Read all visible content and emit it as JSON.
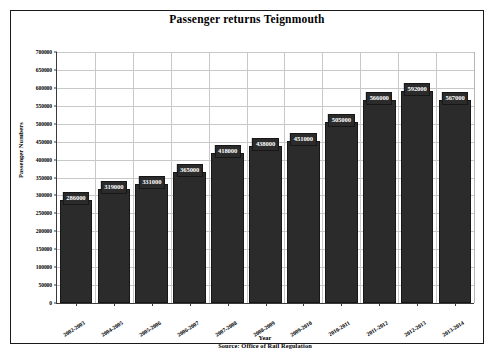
{
  "chart_data": {
    "type": "bar",
    "title": "Passenger returns Teignmouth",
    "xlabel": "Year",
    "ylabel": "Passenger Numbers",
    "source": "Source: Office of Rail Regulation",
    "categories": [
      "2002-2003",
      "2004-2005",
      "2005-2006",
      "2006-2007",
      "2007-2008",
      "2008-2009",
      "2009-2010",
      "2010-2011",
      "2011-2012",
      "2012-2013",
      "2013-2014"
    ],
    "values": [
      286000,
      319000,
      331000,
      365000,
      418000,
      438000,
      451000,
      505000,
      566000,
      592000,
      567000
    ],
    "value_labels": [
      "286000",
      "319000",
      "331000",
      "365000",
      "418000",
      "438000",
      "451000",
      "505000",
      "566000",
      "592000",
      "567000"
    ],
    "ylim": [
      0,
      700000
    ],
    "ytick_values": [
      0,
      50000,
      100000,
      150000,
      200000,
      250000,
      300000,
      350000,
      400000,
      450000,
      500000,
      550000,
      600000,
      650000,
      700000
    ],
    "ytick_labels": [
      "0",
      "50000",
      "100000",
      "150000",
      "200000",
      "250000",
      "300000",
      "350000",
      "400000",
      "450000",
      "500000",
      "550000",
      "600000",
      "650000",
      "700000"
    ],
    "grid": true,
    "legend": false,
    "bar_color": "#2b2b2b",
    "grid_color": "#c8c8c8",
    "axis_color": "#3a3a3a",
    "label_text_color": "#ffffff"
  }
}
